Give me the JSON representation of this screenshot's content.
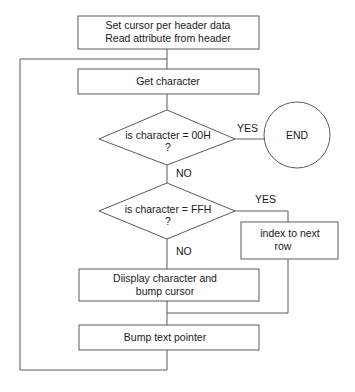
{
  "flowchart": {
    "steps": {
      "init": {
        "line1": "Set cursor per header data",
        "line2": "Read attribute from header"
      },
      "get_char": {
        "label": "Get character"
      },
      "check_end": {
        "line1": "is character  =  00H",
        "line2": "?"
      },
      "end": {
        "label": "END"
      },
      "check_ffh": {
        "line1": "is character  =  FFH",
        "line2": "?"
      },
      "index_row": {
        "line1": "index to next",
        "line2": "row"
      },
      "display": {
        "line1": "Diisplay character and",
        "line2": "bump cursor"
      },
      "bump_ptr": {
        "label": "Bump text pointer"
      }
    },
    "labels": {
      "yes_end": "YES",
      "no_end": "NO",
      "yes_ffh": "YES",
      "no_ffh": "NO"
    },
    "colors": {
      "stroke": "#5a5a5a",
      "text": "#1a1a1a",
      "background": "#ffffff"
    }
  }
}
